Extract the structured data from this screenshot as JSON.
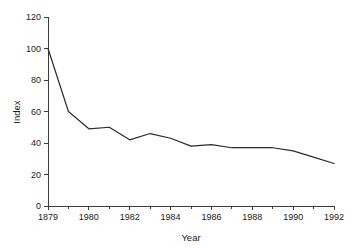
{
  "chart_data": {
    "type": "line",
    "title": "",
    "subtitle": "",
    "xlabel": "Year",
    "ylabel": "Index",
    "grid": false,
    "legend": false,
    "legend_position": "none",
    "xlim": [
      1978,
      1992
    ],
    "ylim": [
      0,
      120
    ],
    "ytick_values": [
      0,
      20,
      40,
      60,
      80,
      100,
      120
    ],
    "ytick_labels": [
      "0",
      "20",
      "40",
      "60",
      "80",
      "100",
      "120"
    ],
    "xtick_values": [
      1978,
      1980,
      1982,
      1984,
      1986,
      1988,
      1990,
      1992
    ],
    "xtick_labels": [
      "1879",
      "1980",
      "1982",
      "1984",
      "1986",
      "1988",
      "1990",
      "1992"
    ],
    "xtick_minor_values": [
      1979,
      1981,
      1983,
      1985,
      1987,
      1989,
      1991
    ],
    "series": [
      {
        "name": "Index",
        "color": "#2b2b2b",
        "x": [
          1978,
          1979,
          1980,
          1981,
          1982,
          1983,
          1984,
          1985,
          1986,
          1987,
          1988,
          1989,
          1990,
          1991,
          1992
        ],
        "values": [
          100,
          60,
          49,
          50,
          42,
          46,
          43,
          38,
          39,
          37,
          37,
          37,
          35,
          31,
          27
        ]
      }
    ]
  },
  "axes": {
    "x_title": "Year",
    "y_title": "Index"
  }
}
